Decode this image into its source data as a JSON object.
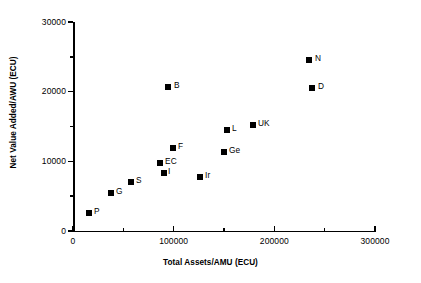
{
  "chart_data": {
    "type": "scatter",
    "title": "",
    "xlabel": "Total Assets/AMU (ECU)",
    "ylabel": "Net Value Added/AWU (ECU)",
    "xlim": [
      0,
      300000
    ],
    "ylim": [
      0,
      30000
    ],
    "x_major_ticks": [
      0,
      100000,
      200000,
      300000
    ],
    "x_minor_ticks": [
      50000,
      150000,
      250000
    ],
    "y_major_ticks": [
      0,
      10000,
      20000,
      30000
    ],
    "y_minor_ticks": [
      5000,
      15000,
      25000
    ],
    "x_tick_labels": [
      "0",
      "100000",
      "200000",
      "300000"
    ],
    "y_tick_labels": [
      "0",
      "10000",
      "20000",
      "30000"
    ],
    "grid": false,
    "legend": false,
    "marker": "square",
    "marker_color": "#000000",
    "points": [
      {
        "label": "P",
        "x": 18600,
        "y": 2600,
        "px": 89,
        "py": 213,
        "label_dx": 5,
        "label_dy": -6
      },
      {
        "label": "G",
        "x": 44200,
        "y": 5500,
        "px": 111,
        "py": 193,
        "label_dx": 5,
        "label_dy": -6
      },
      {
        "label": "S",
        "x": 67400,
        "y": 7000,
        "px": 131,
        "py": 182,
        "label_dx": 5,
        "label_dy": -6
      },
      {
        "label": "EC",
        "x": 101200,
        "y": 9800,
        "px": 160,
        "py": 163,
        "label_dx": 5,
        "label_dy": -6
      },
      {
        "label": "I",
        "x": 105800,
        "y": 8300,
        "px": 164,
        "py": 173,
        "label_dx": 4,
        "label_dy": -6
      },
      {
        "label": "F",
        "x": 116300,
        "y": 11900,
        "px": 173,
        "py": 148,
        "label_dx": 5,
        "label_dy": -6
      },
      {
        "label": "B",
        "x": 110500,
        "y": 20700,
        "px": 168,
        "py": 87,
        "label_dx": 6,
        "label_dy": -6
      },
      {
        "label": "Ir",
        "x": 147700,
        "y": 7800,
        "px": 200,
        "py": 177,
        "label_dx": 5,
        "label_dy": -6
      },
      {
        "label": "Ge",
        "x": 175600,
        "y": 11300,
        "px": 224,
        "py": 152,
        "label_dx": 5,
        "label_dy": -6
      },
      {
        "label": "L",
        "x": 179100,
        "y": 14500,
        "px": 227,
        "py": 130,
        "label_dx": 5,
        "label_dy": -6
      },
      {
        "label": "UK",
        "x": 209300,
        "y": 15200,
        "px": 253,
        "py": 125,
        "label_dx": 5,
        "label_dy": -6
      },
      {
        "label": "N",
        "x": 274400,
        "y": 24500,
        "px": 309,
        "py": 60,
        "label_dx": 6,
        "label_dy": -6
      },
      {
        "label": "D",
        "x": 278000,
        "y": 20500,
        "px": 312,
        "py": 88,
        "label_dx": 6,
        "label_dy": -6
      }
    ]
  },
  "axes": {
    "x_title": "Total Assets/AMU (ECU)",
    "y_title": "Net Value Added/AWU (ECU)"
  }
}
